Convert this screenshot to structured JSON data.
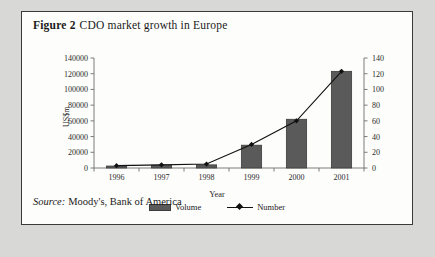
{
  "figure": {
    "label": "Figure 2",
    "caption": "CDO market growth in Europe",
    "source_label": "Source:",
    "source_text": "Moody's, Bank of America"
  },
  "legend": {
    "volume_label": "Volume",
    "number_label": "Number"
  },
  "colors": {
    "bar_fill": "#5a5a5a",
    "bar_stroke": "#3d3d3d",
    "line": "#111111",
    "frame": "#3a3a3a",
    "page_background": "#d8d8d6",
    "panel_background": "#fdfdfb"
  },
  "chart_data": {
    "type": "bar",
    "title": "CDO market growth in Europe",
    "categories": [
      "1996",
      "1997",
      "1998",
      "1999",
      "2000",
      "2001"
    ],
    "xlabel": "Year",
    "ylabel": "US$m",
    "y2label": "",
    "ylim": [
      0,
      140000
    ],
    "y2lim": [
      0,
      140
    ],
    "yticks": [
      0,
      20000,
      40000,
      60000,
      80000,
      100000,
      120000,
      140000
    ],
    "yticklabels": [
      "0",
      "20000",
      "40000",
      "60000",
      "80000",
      "100000",
      "120000",
      "140000"
    ],
    "y2ticks": [
      0,
      20,
      40,
      60,
      80,
      100,
      120,
      140
    ],
    "y2ticklabels": [
      "0",
      "20",
      "40",
      "60",
      "80",
      "100",
      "120",
      "140"
    ],
    "grid": false,
    "legend_position": "bottom",
    "series": [
      {
        "name": "Volume",
        "type": "bar",
        "axis": "left",
        "units": "US$m",
        "values": [
          2500,
          3500,
          4000,
          29000,
          62000,
          123000
        ]
      },
      {
        "name": "Number",
        "type": "line",
        "axis": "right",
        "marker": "diamond",
        "values": [
          3,
          4,
          5,
          30,
          60,
          123
        ]
      }
    ]
  }
}
